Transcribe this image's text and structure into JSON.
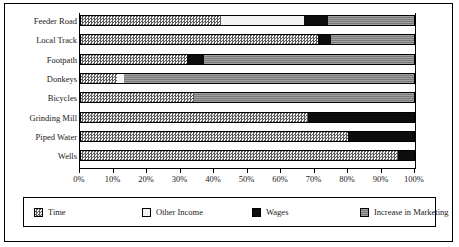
{
  "chart_data": {
    "type": "bar",
    "orientation": "horizontal",
    "stacked": true,
    "normalized": true,
    "title": "",
    "xlabel": "",
    "ylabel": "",
    "xlim": [
      0,
      100
    ],
    "xticks": [
      0,
      10,
      20,
      30,
      40,
      50,
      60,
      70,
      80,
      90,
      100
    ],
    "xticklabels": [
      "0%",
      "10%",
      "20%",
      "30%",
      "40%",
      "50%",
      "60%",
      "70%",
      "80%",
      "90%",
      "100%"
    ],
    "grid": false,
    "legend_position": "bottom",
    "categories": [
      "Feeder Road",
      "Local Track",
      "Footpath",
      "Donkeys",
      "Bicycles",
      "Grinding Mill",
      "Piped Water",
      "Wells"
    ],
    "series": [
      {
        "name": "Time",
        "pattern": "checkered",
        "color": "#b9b9b9",
        "values": [
          42,
          71,
          32,
          11,
          34,
          68,
          80,
          95
        ]
      },
      {
        "name": "Other Income",
        "pattern": "solid-white",
        "color": "#f4f4f4",
        "values": [
          25,
          0,
          0,
          2,
          0,
          0,
          0,
          0
        ]
      },
      {
        "name": "Wages",
        "pattern": "solid-black",
        "color": "#0d0d0d",
        "values": [
          7,
          4,
          5,
          0,
          0,
          32,
          20,
          5
        ]
      },
      {
        "name": "Increase in Marketing",
        "pattern": "horizontal-lines",
        "color": "#8a8a8a",
        "values": [
          26,
          25,
          63,
          87,
          66,
          0,
          0,
          0
        ]
      }
    ]
  },
  "legend": {
    "items": [
      {
        "label": "Time"
      },
      {
        "label": "Other Income"
      },
      {
        "label": "Wages"
      },
      {
        "label": "Increase in Marketing"
      }
    ]
  }
}
